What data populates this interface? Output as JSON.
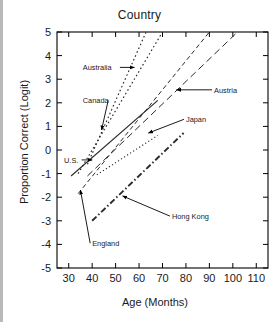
{
  "figure": {
    "title": "Country",
    "xlabel": "Age (Months)",
    "ylabel": "Proportion Correct (Logit)"
  },
  "axes": {
    "x_ticks": [
      "30",
      "40",
      "50",
      "60",
      "70",
      "80",
      "90",
      "100",
      "110"
    ],
    "y_ticks": [
      "5",
      "4",
      "3",
      "2",
      "1",
      "0",
      "-1",
      "-2",
      "-3",
      "-4",
      "-5"
    ]
  },
  "annotations": {
    "australia": "Australia",
    "canada": "Canada",
    "austria": "Austria",
    "japan": "Japan",
    "us": "U.S.",
    "england": "England",
    "hong_kong": "Hong Kong"
  },
  "chart_data": {
    "type": "line",
    "title": "Country",
    "xlabel": "Age (Months)",
    "ylabel": "Proportion Correct (Logit)",
    "xlim": [
      25,
      115
    ],
    "ylim": [
      -5,
      5
    ],
    "xticks": [
      30,
      40,
      50,
      60,
      70,
      80,
      90,
      100,
      110
    ],
    "yticks": [
      -5,
      -4,
      -3,
      -2,
      -1,
      0,
      1,
      2,
      3,
      4,
      5
    ],
    "grid": false,
    "legend": "none (inline arrow annotations)",
    "series": [
      {
        "name": "Australia",
        "style": "dotted",
        "x": [
          38,
          63
        ],
        "y": [
          -0.6,
          5.0
        ],
        "label_xy": [
          36,
          3.5
        ],
        "arrow_to": [
          58,
          3.5
        ]
      },
      {
        "name": "Canada",
        "style": "dotted",
        "x": [
          34,
          70
        ],
        "y": [
          -1.0,
          5.0
        ],
        "label_xy": [
          36,
          2.1
        ],
        "arrow_to": [
          44,
          0.85
        ]
      },
      {
        "name": "Austria",
        "style": "dashed-long",
        "x": [
          38,
          102
        ],
        "y": [
          -1.1,
          5.0
        ],
        "label_xy": [
          92,
          2.55
        ],
        "arrow_to": [
          76,
          2.55
        ]
      },
      {
        "name": "U.S.",
        "style": "solid",
        "x": [
          31,
          68
        ],
        "y": [
          -1.1,
          2.1
        ],
        "label_xy": [
          28,
          -0.42
        ],
        "arrow_to": [
          40,
          -0.42
        ]
      },
      {
        "name": "Japan",
        "style": "dotted-fine",
        "x": [
          42,
          68
        ],
        "y": [
          -1.05,
          0.62
        ],
        "label_xy": [
          80,
          1.3
        ],
        "arrow_to": [
          64,
          0.72
        ]
      },
      {
        "name": "England",
        "style": "dashed",
        "x": [
          34,
          90
        ],
        "y": [
          -1.85,
          5.0
        ],
        "label_xy": [
          40,
          -3.95
        ],
        "arrow_to": [
          35,
          -1.7
        ]
      },
      {
        "name": "Hong Kong",
        "style": "dash-dot",
        "x": [
          40,
          79
        ],
        "y": [
          -3.0,
          0.72
        ],
        "label_xy": [
          74,
          -2.8
        ],
        "arrow_to": [
          53,
          -1.95
        ]
      }
    ]
  }
}
